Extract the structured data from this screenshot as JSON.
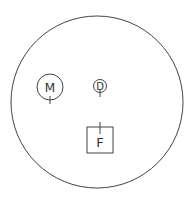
{
  "diagram": {
    "outer_circle": {
      "cx": 97,
      "cy": 102,
      "r": 86
    },
    "stroke_color": "#444444",
    "nodes": [
      {
        "id": "M",
        "label": "M",
        "shape": "circle",
        "cx": 50,
        "cy": 87,
        "r": 13
      },
      {
        "id": "D",
        "label": "D",
        "shape": "circle",
        "cx": 100,
        "cy": 86,
        "r": 6
      },
      {
        "id": "F",
        "label": "F",
        "shape": "square",
        "x": 87,
        "y": 127,
        "size": 26
      }
    ]
  }
}
